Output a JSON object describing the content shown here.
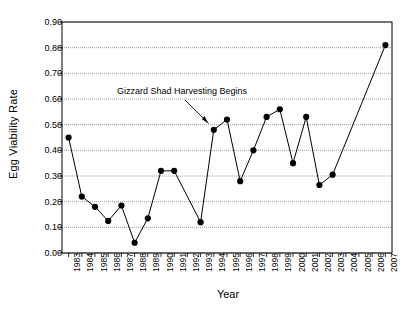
{
  "chart_data": {
    "type": "line",
    "title": "",
    "xlabel": "Year",
    "ylabel": "Egg Viability Rate",
    "xlim": [
      1982.5,
      2007.5
    ],
    "ylim": [
      0.0,
      0.9
    ],
    "grid": true,
    "legend": null,
    "yticks": [
      "0.00",
      "0.10",
      "0.20",
      "0.30",
      "0.40",
      "0.50",
      "0.60",
      "0.70",
      "0.80",
      "0.90"
    ],
    "ytick_values": [
      0.0,
      0.1,
      0.2,
      0.3,
      0.4,
      0.5,
      0.6,
      0.7,
      0.8,
      0.9
    ],
    "categories": [
      "1983",
      "1984",
      "1985",
      "1986",
      "1987",
      "1988",
      "1989",
      "1990",
      "1991",
      "1992",
      "1993",
      "1994",
      "1995",
      "1996",
      "1997",
      "1998",
      "1999",
      "2000",
      "2001",
      "2002",
      "2003",
      "2004",
      "2005",
      "2006",
      "2007"
    ],
    "series": [
      {
        "name": "Egg Viability Rate",
        "marker": "filled-circle",
        "color": "#000000",
        "x": [
          1983,
          1984,
          1985,
          1986,
          1987,
          1988,
          1989,
          1990,
          1991,
          1993,
          1994,
          1995,
          1996,
          1997,
          1998,
          1999,
          2000,
          2001,
          2002,
          2003,
          2007
        ],
        "values": [
          0.45,
          0.22,
          0.18,
          0.125,
          0.185,
          0.04,
          0.135,
          0.32,
          0.32,
          0.12,
          0.48,
          0.52,
          0.28,
          0.4,
          0.53,
          0.56,
          0.35,
          0.53,
          0.265,
          0.305,
          0.81
        ]
      }
    ],
    "annotations": [
      {
        "text": "Gizzard Shad Harvesting Begins",
        "target_x": 1993.6,
        "target_y": 0.505,
        "note": "arrow points to 1994 region at ~0.50"
      }
    ]
  }
}
